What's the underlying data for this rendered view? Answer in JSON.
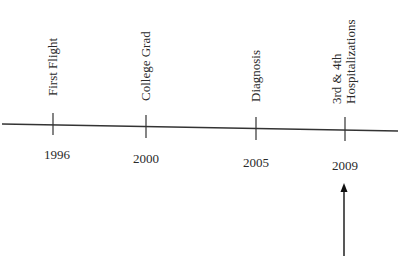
{
  "timeline": {
    "events": [
      {
        "year": "1996",
        "label_lines": [
          "First Flight"
        ]
      },
      {
        "year": "2000",
        "label_lines": [
          "College Grad"
        ]
      },
      {
        "year": "2005",
        "label_lines": [
          "Diagnosis"
        ]
      },
      {
        "year": "2009",
        "label_lines": [
          "3rd & 4th",
          "Hospitalizations"
        ]
      }
    ],
    "pointer": {
      "target_year": "2009",
      "direction": "up"
    },
    "colors": {
      "line": "#333333",
      "text": "#2a2a2a",
      "background": "#ffffff"
    }
  }
}
